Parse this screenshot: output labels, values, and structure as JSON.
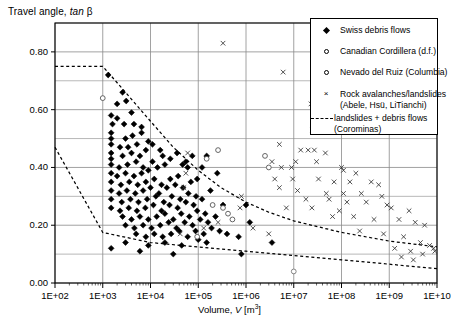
{
  "chart_data": {
    "type": "scatter",
    "title": "Travel angle, tan β",
    "ylabel": "Travel angle, tan β",
    "xlabel": "Volume, V [m3]",
    "xlabel_parts": {
      "prefix": "Volume, ",
      "italic": "V",
      "suffix": " [m",
      "sup": "3",
      "tail": "]"
    },
    "xscale": "log",
    "yscale": "linear",
    "xlim": [
      100,
      10000000000
    ],
    "ylim": [
      0.0,
      0.9
    ],
    "grid": true,
    "grid_minor_y": true,
    "legend_position": "top-right",
    "xticks": [
      "1E+02",
      "1E+03",
      "1E+04",
      "1E+05",
      "1E+06",
      "1E+07",
      "1E+08",
      "1E+09",
      "1E+10"
    ],
    "xtick_values": [
      100,
      1000,
      10000,
      100000,
      1000000,
      10000000,
      100000000,
      1000000000,
      10000000000
    ],
    "yticks": [
      "0.00",
      "0.20",
      "0.40",
      "0.60",
      "0.80"
    ],
    "ytick_values": [
      0.0,
      0.2,
      0.4,
      0.6,
      0.8
    ],
    "yminor_values": [
      0.1,
      0.3,
      0.5,
      0.7,
      0.9
    ],
    "series": [
      {
        "name": "Swiss debris flows",
        "marker": "filled-diamond",
        "color": "#000000",
        "points": [
          [
            1300,
            0.72
          ],
          [
            2600,
            0.66
          ],
          [
            3100,
            0.63
          ],
          [
            1500,
            0.58
          ],
          [
            2000,
            0.57
          ],
          [
            1600,
            0.55
          ],
          [
            2800,
            0.55
          ],
          [
            1500,
            0.52
          ],
          [
            1500,
            0.5
          ],
          [
            3000,
            0.5
          ],
          [
            4200,
            0.51
          ],
          [
            1500,
            0.48
          ],
          [
            2300,
            0.47
          ],
          [
            3400,
            0.47
          ],
          [
            5200,
            0.48
          ],
          [
            1500,
            0.45
          ],
          [
            1500,
            0.43
          ],
          [
            2600,
            0.44
          ],
          [
            4000,
            0.45
          ],
          [
            6000,
            0.44
          ],
          [
            8000,
            0.46
          ],
          [
            1500,
            0.41
          ],
          [
            2200,
            0.4
          ],
          [
            3300,
            0.41
          ],
          [
            5000,
            0.42
          ],
          [
            7000,
            0.4
          ],
          [
            11000,
            0.42
          ],
          [
            1500,
            0.38
          ],
          [
            2000,
            0.37
          ],
          [
            3000,
            0.38
          ],
          [
            4500,
            0.37
          ],
          [
            6500,
            0.38
          ],
          [
            9000,
            0.39
          ],
          [
            14000,
            0.4
          ],
          [
            20000,
            0.41
          ],
          [
            1500,
            0.35
          ],
          [
            2400,
            0.34
          ],
          [
            3600,
            0.35
          ],
          [
            5400,
            0.34
          ],
          [
            8000,
            0.35
          ],
          [
            12000,
            0.36
          ],
          [
            17000,
            0.34
          ],
          [
            26000,
            0.36
          ],
          [
            38000,
            0.37
          ],
          [
            1500,
            0.32
          ],
          [
            2200,
            0.31
          ],
          [
            3200,
            0.32
          ],
          [
            4800,
            0.31
          ],
          [
            7000,
            0.32
          ],
          [
            10000,
            0.33
          ],
          [
            15000,
            0.31
          ],
          [
            22000,
            0.33
          ],
          [
            33000,
            0.34
          ],
          [
            48000,
            0.33
          ],
          [
            70000,
            0.35
          ],
          [
            1500,
            0.29
          ],
          [
            2500,
            0.28
          ],
          [
            3800,
            0.29
          ],
          [
            5600,
            0.28
          ],
          [
            8500,
            0.29
          ],
          [
            13000,
            0.3
          ],
          [
            19000,
            0.28
          ],
          [
            28000,
            0.3
          ],
          [
            42000,
            0.29
          ],
          [
            62000,
            0.31
          ],
          [
            90000,
            0.3
          ],
          [
            1500,
            0.26
          ],
          [
            2300,
            0.25
          ],
          [
            3500,
            0.26
          ],
          [
            5200,
            0.25
          ],
          [
            7800,
            0.26
          ],
          [
            11500,
            0.27
          ],
          [
            17000,
            0.25
          ],
          [
            25000,
            0.27
          ],
          [
            37000,
            0.26
          ],
          [
            55000,
            0.28
          ],
          [
            80000,
            0.27
          ],
          [
            120000,
            0.29
          ],
          [
            2600,
            0.23
          ],
          [
            4000,
            0.22
          ],
          [
            6000,
            0.23
          ],
          [
            9000,
            0.22
          ],
          [
            13500,
            0.23
          ],
          [
            20000,
            0.24
          ],
          [
            30000,
            0.22
          ],
          [
            44000,
            0.24
          ],
          [
            65000,
            0.23
          ],
          [
            95000,
            0.25
          ],
          [
            140000,
            0.24
          ],
          [
            3000,
            0.2
          ],
          [
            4600,
            0.19
          ],
          [
            7000,
            0.2
          ],
          [
            10500,
            0.19
          ],
          [
            16000,
            0.2
          ],
          [
            24000,
            0.21
          ],
          [
            35000,
            0.19
          ],
          [
            52000,
            0.21
          ],
          [
            76000,
            0.2
          ],
          [
            110000,
            0.22
          ],
          [
            160000,
            0.21
          ],
          [
            230000,
            0.23
          ],
          [
            5000,
            0.17
          ],
          [
            8000,
            0.16
          ],
          [
            12000,
            0.17
          ],
          [
            18000,
            0.16
          ],
          [
            27000,
            0.17
          ],
          [
            40000,
            0.18
          ],
          [
            60000,
            0.16
          ],
          [
            88000,
            0.18
          ],
          [
            130000,
            0.17
          ],
          [
            190000,
            0.19
          ],
          [
            280000,
            0.18
          ],
          [
            3000,
            0.14
          ],
          [
            9000,
            0.13
          ],
          [
            20000,
            0.14
          ],
          [
            45000,
            0.13
          ],
          [
            100000,
            0.15
          ],
          [
            150000,
            0.14
          ],
          [
            400000,
            0.17
          ],
          [
            1200000,
            0.21
          ],
          [
            700000,
            0.16
          ],
          [
            3500000,
            0.14
          ],
          [
            1000000,
            0.27
          ],
          [
            330000,
            0.27
          ],
          [
            180000,
            0.32
          ],
          [
            250000,
            0.38
          ],
          [
            120000,
            0.4
          ],
          [
            150000,
            0.44
          ],
          [
            95000,
            0.36
          ],
          [
            60000,
            0.4
          ],
          [
            75000,
            0.44
          ],
          [
            47000,
            0.41
          ],
          [
            1500,
            0.12
          ],
          [
            6000,
            0.11
          ],
          [
            30000,
            0.1
          ],
          [
            800000,
            0.1
          ],
          [
            18000,
            0.44
          ],
          [
            26000,
            0.43
          ],
          [
            36000,
            0.45
          ],
          [
            55000,
            0.42
          ],
          [
            11000,
            0.48
          ],
          [
            16000,
            0.46
          ],
          [
            6500,
            0.52
          ],
          [
            9000,
            0.49
          ],
          [
            4500,
            0.55
          ],
          [
            6500,
            0.54
          ],
          [
            2000,
            0.62
          ],
          [
            4000,
            0.59
          ]
        ]
      },
      {
        "name": "Canadian Cordillera (d.f.)",
        "marker": "open-circle",
        "color": "#555555",
        "points": [
          [
            1000,
            0.64
          ],
          [
            150000,
            0.43
          ],
          [
            200000,
            0.27
          ],
          [
            330000,
            0.26
          ],
          [
            420000,
            0.24
          ],
          [
            520000,
            0.22
          ],
          [
            95000,
            0.16
          ],
          [
            2500000,
            0.44
          ],
          [
            3000000,
            0.4
          ],
          [
            260000,
            0.46
          ]
        ]
      },
      {
        "name": "Nevado del Ruiz (Columbia)",
        "marker": "open-circle",
        "color": "#777777",
        "points": [
          [
            10000000,
            0.04
          ]
        ]
      },
      {
        "name": "Rock avalanches/landslides (Abele, Hsü, LiTianchi)",
        "marker": "x",
        "color": "#333333",
        "points": [
          [
            330000,
            0.83
          ],
          [
            6000000,
            0.73
          ],
          [
            60000,
            0.45
          ],
          [
            55000,
            0.38
          ],
          [
            50000,
            0.33
          ],
          [
            800000,
            0.3
          ],
          [
            750000,
            0.26
          ],
          [
            260000,
            0.21
          ],
          [
            130000,
            0.19
          ],
          [
            1400000,
            0.19
          ],
          [
            3000000,
            0.17
          ],
          [
            42000,
            0.17
          ],
          [
            23000000,
            0.62
          ],
          [
            25000000,
            0.53
          ],
          [
            27000000,
            0.46
          ],
          [
            5000000,
            0.48
          ],
          [
            14000000,
            0.46
          ],
          [
            20000000,
            0.46
          ],
          [
            46000000,
            0.45
          ],
          [
            3500000,
            0.42
          ],
          [
            11000000,
            0.42
          ],
          [
            30000000,
            0.42
          ],
          [
            5500000,
            0.4
          ],
          [
            9000000,
            0.4
          ],
          [
            100000000,
            0.4
          ],
          [
            110000000,
            0.39
          ],
          [
            200000000,
            0.38
          ],
          [
            4000000,
            0.36
          ],
          [
            9500000,
            0.36
          ],
          [
            33000000,
            0.36
          ],
          [
            70000000,
            0.35
          ],
          [
            150000000,
            0.35
          ],
          [
            420000000,
            0.35
          ],
          [
            600000000,
            0.34
          ],
          [
            5000000,
            0.33
          ],
          [
            12000000,
            0.32
          ],
          [
            48000000,
            0.31
          ],
          [
            110000000,
            0.31
          ],
          [
            260000000,
            0.31
          ],
          [
            700000000,
            0.3
          ],
          [
            18000000,
            0.29
          ],
          [
            55000000,
            0.29
          ],
          [
            130000000,
            0.28
          ],
          [
            330000000,
            0.28
          ],
          [
            900000000,
            0.27
          ],
          [
            7000000,
            0.26
          ],
          [
            24000000,
            0.26
          ],
          [
            90000000,
            0.25
          ],
          [
            1100000000,
            0.26
          ],
          [
            2600000000,
            0.25
          ],
          [
            65000000,
            0.23
          ],
          [
            180000000,
            0.23
          ],
          [
            480000000,
            0.22
          ],
          [
            1600000000,
            0.22
          ],
          [
            3500000000,
            0.21
          ],
          [
            5500000000,
            0.2
          ],
          [
            240000000,
            0.18
          ],
          [
            760000000,
            0.17
          ],
          [
            2000000000,
            0.16
          ],
          [
            4500000000,
            0.14
          ],
          [
            7000000000,
            0.13
          ],
          [
            2800000000,
            0.11
          ],
          [
            1300000000,
            0.12
          ],
          [
            8500000000,
            0.12
          ],
          [
            1800000000,
            0.09
          ],
          [
            3200000000,
            0.08
          ],
          [
            5000000000,
            0.1
          ],
          [
            9000000000,
            0.11
          ]
        ]
      }
    ],
    "boundary_lines": [
      {
        "name": "landslides + debris flows (Corominas) upper",
        "style": "dashed",
        "points": [
          [
            100,
            0.75
          ],
          [
            1000,
            0.75
          ],
          [
            3000,
            0.66
          ],
          [
            10000,
            0.56
          ],
          [
            30000,
            0.47
          ],
          [
            100000,
            0.39
          ],
          [
            300000,
            0.33
          ],
          [
            1000000,
            0.28
          ],
          [
            3000000,
            0.245
          ],
          [
            10000000,
            0.215
          ],
          [
            100000000,
            0.175
          ],
          [
            1000000000,
            0.145
          ],
          [
            10000000000,
            0.125
          ]
        ]
      },
      {
        "name": "landslides + debris flows (Corominas) lower",
        "style": "dashed",
        "points": [
          [
            100,
            0.47
          ],
          [
            1000,
            0.175
          ],
          [
            10000,
            0.14
          ],
          [
            100000,
            0.125
          ],
          [
            1000000,
            0.11
          ],
          [
            10000000,
            0.095
          ],
          [
            100000000,
            0.08
          ],
          [
            1000000000,
            0.065
          ],
          [
            10000000000,
            0.05
          ]
        ]
      }
    ],
    "legend": [
      {
        "label": "Swiss debris flows",
        "marker": "filled-diamond"
      },
      {
        "label": "Canadian Cordillera (d.f.)",
        "marker": "open-circle"
      },
      {
        "label": "Nevado del Ruiz (Columbia)",
        "marker": "open-circle"
      },
      {
        "label": "Rock avalanches/landslides",
        "label2": "(Abele, Hsü, LiTianchi)",
        "marker": "x"
      },
      {
        "label": "landslides + debris flows",
        "label2": "(Corominas)",
        "marker": "dashed-line"
      }
    ]
  }
}
